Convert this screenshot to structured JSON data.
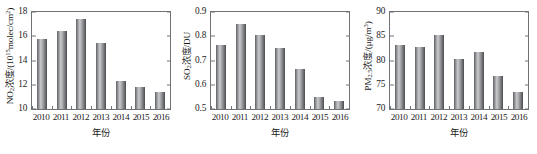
{
  "figure": {
    "background": "#ffffff",
    "bar_color_light": "#c9cbcd",
    "bar_color_dark": "#5d5f63",
    "axis_color": "#6f7277"
  },
  "chart_data": [
    {
      "type": "bar",
      "title": "",
      "xlabel": "年份",
      "ylabel": "NO₂浓度/(10¹⁵molec/cm²)",
      "ylabel_parts": {
        "species": "NO",
        "species_sub": "2",
        "text": "浓度/(10",
        "exp": "15",
        "unit": "molec/cm",
        "unit_exp": "2",
        "close": ")"
      },
      "categories": [
        "2010",
        "2011",
        "2012",
        "2013",
        "2014",
        "2015",
        "2016"
      ],
      "values": [
        15.8,
        16.4,
        17.45,
        15.45,
        12.3,
        11.8,
        11.4
      ],
      "ylim": [
        10,
        18
      ],
      "yticks": [
        "10",
        "12",
        "14",
        "16",
        "18"
      ],
      "ytick_values": [
        10,
        12,
        14,
        16,
        18
      ],
      "grid": false,
      "legend": "none"
    },
    {
      "type": "bar",
      "title": "",
      "xlabel": "年份",
      "ylabel": "SO₂浓度/DU",
      "ylabel_parts": {
        "species": "SO",
        "species_sub": "2",
        "text": "浓度/DU",
        "exp": "",
        "unit": "",
        "unit_exp": "",
        "close": ""
      },
      "categories": [
        "2010",
        "2011",
        "2012",
        "2013",
        "2014",
        "2015",
        "2016"
      ],
      "values": [
        0.762,
        0.85,
        0.805,
        0.75,
        0.667,
        0.548,
        0.533
      ],
      "ylim": [
        0.5,
        0.9
      ],
      "yticks": [
        "0.5",
        "0.6",
        "0.7",
        "0.8",
        "0.9"
      ],
      "ytick_values": [
        0.5,
        0.6,
        0.7,
        0.8,
        0.9
      ],
      "grid": false,
      "legend": "none"
    },
    {
      "type": "bar",
      "title": "",
      "xlabel": "年份",
      "ylabel": "PM₂.₅浓度/(μg/m³)",
      "ylabel_parts": {
        "species": "PM",
        "species_sub": "2.5",
        "text": "浓度/(μg/m",
        "exp": "",
        "unit": "",
        "unit_exp": "3",
        "close": ")"
      },
      "categories": [
        "2010",
        "2011",
        "2012",
        "2013",
        "2014",
        "2015",
        "2016"
      ],
      "values": [
        83.3,
        82.7,
        85.2,
        80.4,
        81.8,
        76.8,
        73.5
      ],
      "ylim": [
        70,
        90
      ],
      "yticks": [
        "70",
        "75",
        "80",
        "85",
        "90"
      ],
      "ytick_values": [
        70,
        75,
        80,
        85,
        90
      ],
      "grid": false,
      "legend": "none"
    }
  ]
}
